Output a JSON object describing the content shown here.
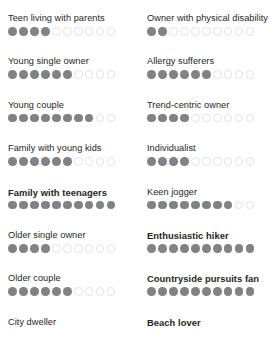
{
  "chart_data": {
    "type": "bar",
    "title": "",
    "subtitle": "",
    "xlabel": "",
    "ylabel": "",
    "scale_max": 10,
    "grid": false,
    "legend": null,
    "colors": {
      "filled_dot": "#808285",
      "empty_dot_border": "#e3e3e4",
      "empty_dot_fill": "#ffffff",
      "label_text": "#231f20",
      "background": "#ffffff"
    },
    "columns": [
      {
        "name": "left-column",
        "categories": [
          "Teen living with parents",
          "Young single owner",
          "Young couple",
          "Family with young kids",
          "Family with teenagers",
          "Older single owner",
          "Older couple",
          "City dweller"
        ],
        "values": [
          4,
          6,
          8,
          6,
          10,
          4,
          6,
          null
        ],
        "bold": [
          false,
          false,
          false,
          false,
          true,
          false,
          false,
          false
        ],
        "truncated": [
          false,
          false,
          false,
          false,
          false,
          false,
          false,
          true
        ]
      },
      {
        "name": "right-column",
        "categories": [
          "Owner with physical disability",
          "Allergy sufferers",
          "Trend-centric owner",
          "Individualist",
          "Keen jogger",
          "Enthusiastic hiker",
          "Countryside pursuits fan",
          "Beach lover"
        ],
        "values": [
          2,
          6,
          4,
          4,
          8,
          10,
          10,
          null
        ],
        "bold": [
          false,
          false,
          false,
          false,
          false,
          true,
          true,
          true
        ],
        "truncated": [
          false,
          false,
          false,
          false,
          false,
          false,
          false,
          true
        ]
      }
    ]
  }
}
